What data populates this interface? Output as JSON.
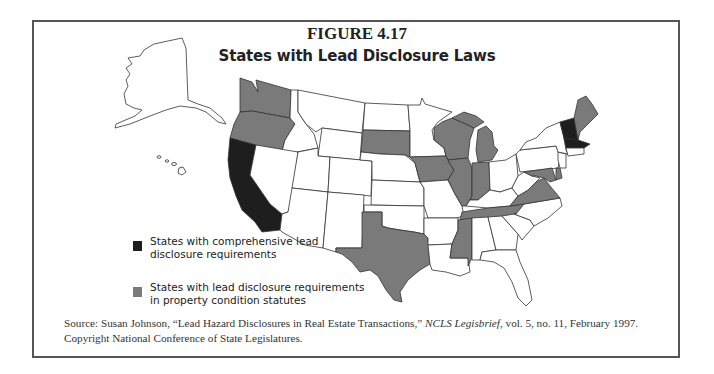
{
  "figure": {
    "number": "FIGURE 4.17",
    "title": "States with Lead Disclosure Laws"
  },
  "legend": {
    "items": [
      {
        "label": "States with comprehensive lead disclosure requirements",
        "color": "#1e1e1e",
        "category": "comprehensive"
      },
      {
        "label": "States with lead disclosure requirements in property condition statutes",
        "color": "#7a7a7a",
        "category": "property-condition"
      }
    ]
  },
  "map": {
    "comprehensive_states": [
      "California",
      "Vermont",
      "New Hampshire",
      "Massachusetts"
    ],
    "property_condition_states": [
      "Washington",
      "Oregon",
      "South Dakota",
      "Iowa",
      "Wisconsin",
      "Illinois",
      "Indiana",
      "Michigan",
      "Texas",
      "Mississippi",
      "Tennessee",
      "Virginia",
      "Maryland",
      "Delaware",
      "Maine"
    ],
    "colors": {
      "comprehensive": "#1e1e1e",
      "property_condition": "#7a7a7a",
      "none": "#ffffff",
      "border": "#333333"
    }
  },
  "source": {
    "prefix": "Source: Susan Johnson, “Lead Hazard Disclosures in Real Estate Transactions,” ",
    "publication": "NCLS Legisbrief",
    "suffix": ", vol. 5, no. 11, February 1997. Copyright National Conference of State Legislatures."
  }
}
